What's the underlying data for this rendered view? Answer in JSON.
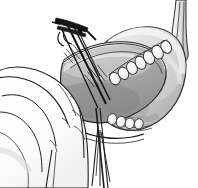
{
  "figure": {
    "kind": "surgical-line-illustration",
    "style": "grayscale pen-and-ink with wash shading",
    "width_px": 198,
    "height_px": 188,
    "background_color": "#ffffff"
  },
  "palette": {
    "background": "#ffffff",
    "ink_dark": "#1d1d1d",
    "ink_mid": "#4a4a4a",
    "ink_light": "#8a8a8a",
    "organ_light": "#e8e8e8",
    "organ_mid": "#c9c9c9",
    "organ_dark": "#a6a6a6",
    "cavity_shadow": "#9b9b9b",
    "highlight": "#f4f4f4",
    "instrument_metal": "#2a2a2a",
    "stone_fill": "#f2f2f2"
  },
  "elements": {
    "organ": {
      "name": "gallbladder-body",
      "label": "Gallbladder fundus and body",
      "fill": "#cfcfcf",
      "outline": "#2b2b2b"
    },
    "cavity": {
      "name": "incision-cavity",
      "label": "Opened tissue bed / incision cavity",
      "fill": "#b5b5b5"
    },
    "stones_upper": {
      "name": "stone-cluster-upper",
      "label": "Upper row of oval stone-like bodies",
      "count": 7,
      "fill": "#f4f4f4"
    },
    "stones_lower": {
      "name": "stone-cluster-lower",
      "label": "Lower row of oval stone-like bodies",
      "count": 4,
      "fill": "#f4f4f4"
    },
    "duct": {
      "name": "cystic-duct",
      "label": "Cystic duct / vessel entering from upper right",
      "fill": "#ededed"
    },
    "hand": {
      "name": "surgeons-hand",
      "label": "Surgeon's hand with four fingers retracting from the left",
      "fill": "#ffffff",
      "finger_count": 4
    },
    "instrument_top": {
      "name": "clip-applier-instrument",
      "label": "Clip applier / forceps entering from upper left",
      "color": "#1a1a1a"
    },
    "instrument_shaft": {
      "name": "instrument-shaft",
      "label": "Long instrument shaft crossing the field",
      "color": "#1a1a1a"
    },
    "instrument_lower": {
      "name": "retractor-suture-bundle",
      "label": "Suture / retractor strands descending below the organ",
      "color": "#1a1a1a"
    },
    "hatching": {
      "name": "shading-hatch-marks",
      "label": "Cross-hatch shading strokes on the tissue surface"
    }
  }
}
